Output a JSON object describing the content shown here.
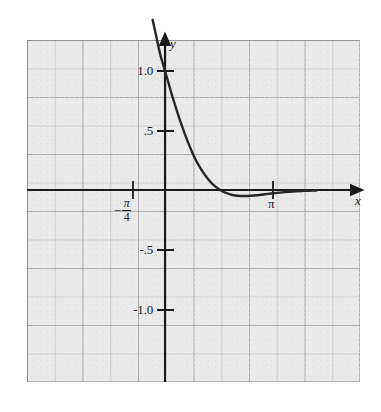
{
  "figure": {
    "name": "exponential-decay-cosine-graph",
    "background_color": "#ffffff",
    "panel_color": "#e9e9e9",
    "curve_color": "#262626",
    "axis_color": "#1a1a1a"
  },
  "axes": {
    "x_axis_label": "x",
    "y_axis_label": "y"
  },
  "chart_data": {
    "type": "line",
    "title": "",
    "subtitle": "",
    "xlabel": "x",
    "ylabel": "y",
    "grid": true,
    "legend_position": "none",
    "xlim": [
      -1.55,
      4.45
    ],
    "ylim": [
      -1.45,
      1.45
    ],
    "x_tick_labels": [
      "-π/4",
      "π"
    ],
    "x_tick_values": [
      -0.785,
      3.1416
    ],
    "y_tick_labels": [
      "1.0",
      ".5",
      "-.5",
      "-1.0"
    ],
    "y_tick_values": [
      1.0,
      0.5,
      -0.5,
      -1.0
    ],
    "series": [
      {
        "name": "curve",
        "x": [
          -0.36,
          -0.3,
          -0.24,
          -0.18,
          -0.12,
          -0.06,
          0.0,
          0.1,
          0.2,
          0.3,
          0.4,
          0.5,
          0.6,
          0.7,
          0.8,
          0.9,
          1.0,
          1.1,
          1.2,
          1.3,
          1.4,
          1.5,
          1.6,
          1.7,
          1.8,
          1.9,
          2.0,
          2.2,
          2.4,
          2.6,
          2.8,
          3.0,
          3.2,
          3.4,
          3.6,
          3.8,
          4.0,
          4.2,
          4.4
        ],
        "y": [
          1.43,
          1.35,
          1.27,
          1.19,
          1.12,
          1.06,
          1.0,
          0.9,
          0.8,
          0.707,
          0.617,
          0.532,
          0.453,
          0.379,
          0.311,
          0.25,
          0.199,
          0.152,
          0.111,
          0.076,
          0.046,
          0.022,
          0.001,
          -0.015,
          -0.027,
          -0.037,
          -0.044,
          -0.05,
          -0.05,
          -0.046,
          -0.04,
          -0.033,
          -0.026,
          -0.02,
          -0.015,
          -0.011,
          -0.008,
          -0.006,
          -0.004
        ]
      }
    ]
  },
  "ticks": {
    "y_1_0": "1.0",
    "y_0_5": ".5",
    "y_neg_0_5": "-.5",
    "y_neg_1_0": "-1.0",
    "x_pi": "π",
    "x_neg_pi_over_4_minus": "−",
    "x_neg_pi_over_4_num": "π",
    "x_neg_pi_over_4_den": "4"
  }
}
